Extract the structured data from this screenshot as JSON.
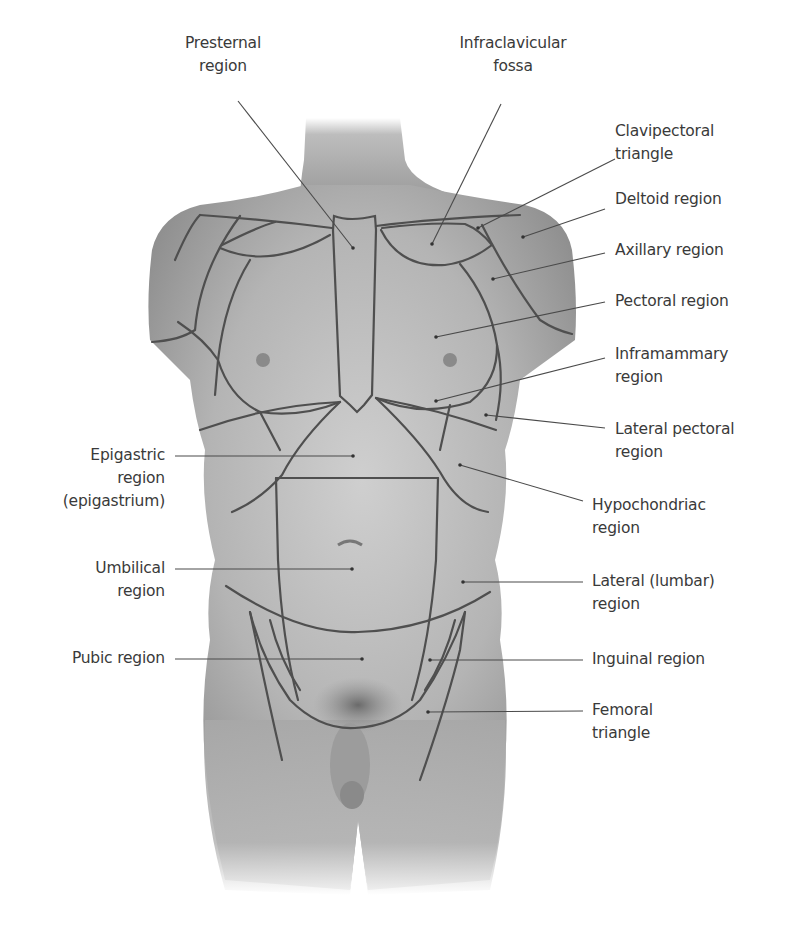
{
  "figure": {
    "colors": {
      "background": "#ffffff",
      "text": "#3a3a3a",
      "leader": "#4a4a4a",
      "region_line": "#4f4f4f",
      "skin_light": "#d6d6d6",
      "skin_mid": "#a9a9a9",
      "skin_dark": "#7c7c7c"
    }
  },
  "labels": {
    "presternal": "Presternal\nregion",
    "infraclavicular": "Infraclavicular\nfossa",
    "clavipectoral": "Clavipectoral\ntriangle",
    "deltoid": "Deltoid region",
    "axillary": "Axillary region",
    "pectoral": "Pectoral region",
    "inframammary": "Inframammary\nregion",
    "lateral_pectoral": "Lateral pectoral\nregion",
    "hypochondriac": "Hypochondriac\nregion",
    "lateral_lumbar": "Lateral (lumbar)\nregion",
    "inguinal": "Inguinal region",
    "femoral": "Femoral\ntriangle",
    "epigastric": "Epigastric\nregion\n(epigastrium)",
    "umbilical": "Umbilical\nregion",
    "pubic": "Pubic region"
  }
}
